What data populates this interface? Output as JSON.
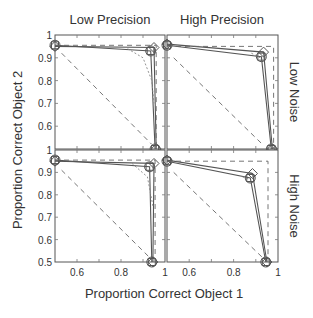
{
  "chart_data": {
    "type": "line",
    "layout": "2x2 small multiples",
    "column_titles": [
      "Low Precision",
      "High Precision"
    ],
    "row_titles": [
      "Low Noise",
      "High Noise"
    ],
    "xlabel": "Proportion Correct Object 1",
    "ylabel": "Proportion Correct Object 2",
    "xlim": [
      0.5,
      1
    ],
    "ylim": [
      0.5,
      1
    ],
    "xticks": [
      "0.6",
      "0.8",
      "1"
    ],
    "yticks": [
      "0.5",
      "0.6",
      "0.7",
      "0.8",
      "0.9",
      "1"
    ],
    "grid": false,
    "panels": [
      {
        "name": "Low Precision / Low Noise",
        "series": [
          {
            "name": "model-diamond",
            "style": "solid",
            "marker": "diamond",
            "points": [
              [
                0.5,
                0.95
              ],
              [
                0.95,
                0.945
              ],
              [
                0.96,
                0.5
              ]
            ]
          },
          {
            "name": "data-circle-square",
            "style": "solid",
            "marker": "square",
            "points": [
              [
                0.5,
                0.955
              ],
              [
                0.935,
                0.93
              ],
              [
                0.955,
                0.5
              ]
            ]
          },
          {
            "name": "optimal-bound",
            "style": "dashed",
            "points": [
              [
                0.5,
                0.955
              ],
              [
                0.96,
                0.955
              ],
              [
                0.96,
                0.5
              ]
            ]
          },
          {
            "name": "chance-diagonal",
            "style": "dashed",
            "points": [
              [
                0.53,
                0.92
              ],
              [
                0.94,
                0.52
              ]
            ]
          },
          {
            "name": "tradeoff-curve",
            "style": "dotted",
            "points": [
              [
                0.83,
                0.94
              ],
              [
                0.9,
                0.9
              ],
              [
                0.94,
                0.8
              ],
              [
                0.95,
                0.7
              ]
            ]
          }
        ]
      },
      {
        "name": "High Precision / Low Noise",
        "series": [
          {
            "name": "model-diamond",
            "style": "solid",
            "marker": "diamond",
            "points": [
              [
                0.5,
                0.96
              ],
              [
                0.935,
                0.925
              ],
              [
                0.975,
                0.5
              ]
            ]
          },
          {
            "name": "data-circle-square",
            "style": "solid",
            "marker": "square",
            "points": [
              [
                0.5,
                0.955
              ],
              [
                0.925,
                0.905
              ],
              [
                0.97,
                0.5
              ]
            ]
          },
          {
            "name": "optimal-bound",
            "style": "dashed",
            "points": [
              [
                0.5,
                0.95
              ],
              [
                0.98,
                0.95
              ],
              [
                0.98,
                0.5
              ]
            ]
          },
          {
            "name": "chance-diagonal",
            "style": "dashed",
            "points": [
              [
                0.53,
                0.9
              ],
              [
                0.93,
                0.52
              ]
            ]
          },
          {
            "name": "tradeoff-curve",
            "style": "dotted",
            "points": [
              [
                0.88,
                0.92
              ],
              [
                0.92,
                0.9
              ]
            ]
          }
        ]
      },
      {
        "name": "Low Precision / High Noise",
        "series": [
          {
            "name": "model-diamond",
            "style": "solid",
            "marker": "diamond",
            "points": [
              [
                0.5,
                0.95
              ],
              [
                0.95,
                0.94
              ],
              [
                0.945,
                0.5
              ]
            ]
          },
          {
            "name": "data-circle-square",
            "style": "solid",
            "marker": "square",
            "points": [
              [
                0.5,
                0.955
              ],
              [
                0.93,
                0.925
              ],
              [
                0.94,
                0.5
              ]
            ]
          },
          {
            "name": "optimal-bound",
            "style": "dashed",
            "points": [
              [
                0.5,
                0.955
              ],
              [
                0.955,
                0.955
              ],
              [
                0.955,
                0.5
              ]
            ]
          },
          {
            "name": "chance-diagonal",
            "style": "dashed",
            "points": [
              [
                0.53,
                0.91
              ],
              [
                0.93,
                0.52
              ]
            ]
          },
          {
            "name": "tradeoff-curve",
            "style": "dotted",
            "points": [
              [
                0.85,
                0.94
              ],
              [
                0.92,
                0.88
              ],
              [
                0.945,
                0.75
              ]
            ]
          }
        ]
      },
      {
        "name": "High Precision / High Noise",
        "series": [
          {
            "name": "model-diamond",
            "style": "solid",
            "marker": "diamond",
            "points": [
              [
                0.5,
                0.955
              ],
              [
                0.885,
                0.895
              ],
              [
                0.95,
                0.5
              ]
            ]
          },
          {
            "name": "data-circle-square",
            "style": "solid",
            "marker": "square",
            "points": [
              [
                0.5,
                0.95
              ],
              [
                0.875,
                0.875
              ],
              [
                0.945,
                0.5
              ]
            ]
          },
          {
            "name": "optimal-bound",
            "style": "dashed",
            "points": [
              [
                0.5,
                0.95
              ],
              [
                0.955,
                0.95
              ],
              [
                0.955,
                0.5
              ]
            ]
          },
          {
            "name": "chance-diagonal",
            "style": "dashed",
            "points": [
              [
                0.53,
                0.9
              ],
              [
                0.93,
                0.52
              ]
            ]
          },
          {
            "name": "tradeoff-curve",
            "style": "dotted",
            "points": [
              [
                0.84,
                0.88
              ],
              [
                0.87,
                0.87
              ]
            ]
          }
        ]
      }
    ]
  }
}
